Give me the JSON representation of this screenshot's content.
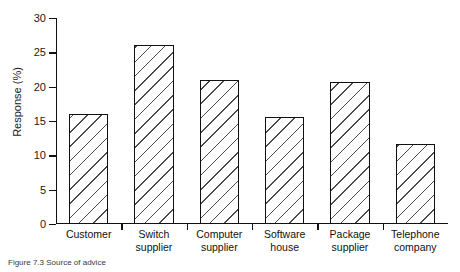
{
  "chart_data": {
    "type": "bar",
    "title": "",
    "xlabel": "",
    "ylabel": "Response (%)",
    "ylim": [
      0,
      30
    ],
    "yticks": [
      0,
      5,
      10,
      15,
      20,
      25,
      30
    ],
    "ytick_labels": [
      "0",
      "5",
      "10",
      "15",
      "20",
      "25",
      "30"
    ],
    "grid": false,
    "legend": "none",
    "categories": [
      "Customer",
      "Switch supplier",
      "Computer supplier",
      "Software house",
      "Package supplier",
      "Telephone company"
    ],
    "category_lines": [
      [
        "Customer"
      ],
      [
        "Switch",
        "supplier"
      ],
      [
        "Computer",
        "supplier"
      ],
      [
        "Software",
        "house"
      ],
      [
        "Package",
        "supplier"
      ],
      [
        "Telephone",
        "company"
      ]
    ],
    "values": [
      16.0,
      26.0,
      21.0,
      15.6,
      20.7,
      11.7
    ],
    "bar_style": {
      "fill": "diagonal-hatch",
      "fill_color": "#ffffff",
      "hatch_color": "#4a4a4a",
      "edge_color": "#111111"
    }
  },
  "caption": {
    "text": "Figure 7.3  Source of advice"
  }
}
